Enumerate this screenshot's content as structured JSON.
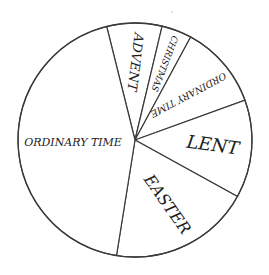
{
  "chart_data": {
    "type": "pie",
    "title": "",
    "start_angle_deg": 346,
    "direction": "clockwise",
    "unit": "weeks (approx., from slice angles)",
    "categories": [
      "Advent",
      "Christmas",
      "Ordinary Time",
      "Lent",
      "Easter",
      "Ordinary Time"
    ],
    "values": [
      4,
      2,
      6,
      7,
      10,
      23
    ],
    "slice_angles_deg": [
      27.4,
      15.0,
      41.7,
      48.8,
      70.2,
      156.9
    ],
    "slices": [
      {
        "label": "ADVENT",
        "value": 4,
        "angle": 27.4,
        "color": "#ffffff",
        "font_size": 13,
        "rotate": 97,
        "label_r": 78
      },
      {
        "label": "CHRISTMAS",
        "value": 2,
        "angle": 15.0,
        "color": "#ffffff",
        "font_size": 9,
        "rotate": 111,
        "label_r": 82
      },
      {
        "label": "ORDINARY TIME",
        "value": 6,
        "angle": 41.7,
        "color": "#ffffff",
        "font_size": 9.5,
        "rotate": 152,
        "label_r": 70
      },
      {
        "label": "LENT",
        "value": 7,
        "angle": 48.8,
        "color": "#ffffff",
        "font_size": 18,
        "rotate": 8,
        "label_r": 78
      },
      {
        "label": "EASTER",
        "value": 10,
        "angle": 70.2,
        "color": "#ffffff",
        "font_size": 16,
        "rotate": 55,
        "label_r": 72
      },
      {
        "label": "ORDINARY TIME",
        "value": 23,
        "angle": 156.9,
        "color": "#ffffff",
        "font_size": 11,
        "rotate": 0,
        "label_r": 62
      }
    ],
    "legend": "none",
    "grid": false,
    "center": [
      135,
      140
    ],
    "radius": 117,
    "stroke_color": "#3a3a3a"
  }
}
